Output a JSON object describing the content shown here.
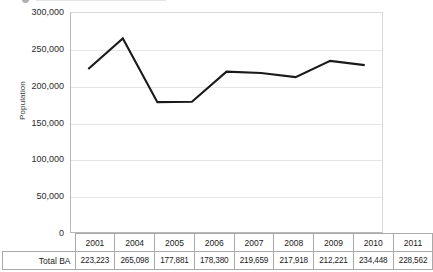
{
  "chart_data": {
    "type": "line",
    "title": "",
    "xlabel": "",
    "ylabel": "Population",
    "categories": [
      "2001",
      "2004",
      "2005",
      "2006",
      "2007",
      "2008",
      "2009",
      "2010",
      "2011"
    ],
    "series": [
      {
        "name": "Total BA",
        "values": [
          223223,
          265098,
          177881,
          178380,
          219659,
          217918,
          212221,
          234448,
          228562
        ]
      }
    ],
    "ylim": [
      0,
      300000
    ],
    "ytick_labels": [
      "0",
      "50,000",
      "100,000",
      "150,000",
      "200,000",
      "250,000",
      "300,000"
    ],
    "ytick_values": [
      0,
      50000,
      100000,
      150000,
      200000,
      250000,
      300000
    ],
    "grid": true,
    "legend": "none",
    "line_color": "#1a1a1a",
    "gridline_color": "#e6e6e6",
    "axis_color": "#b9b9b9"
  },
  "table": {
    "row_header_label": "Total BA",
    "years": [
      "2001",
      "2004",
      "2005",
      "2006",
      "2007",
      "2008",
      "2009",
      "2010",
      "2011"
    ],
    "values": [
      "223,223",
      "265,098",
      "177,881",
      "178,380",
      "219,659",
      "217,918",
      "212,221",
      "234,448",
      "228,562"
    ]
  }
}
